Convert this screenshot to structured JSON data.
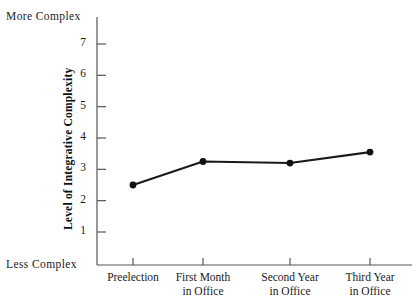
{
  "chart_data": {
    "type": "line",
    "title": "",
    "subtitle": "",
    "xlabel": "",
    "ylabel": "Level of Integrative Complexity",
    "categories": [
      "Preelection",
      "First Month\nin Office",
      "Second Year\nin Office",
      "Third Year\nin Office"
    ],
    "series": [
      {
        "name": "Integrative Complexity",
        "values": [
          2.5,
          3.25,
          3.2,
          3.55
        ]
      }
    ],
    "yticks": [
      1,
      2,
      3,
      4,
      5,
      6,
      7
    ],
    "ytick_labels": [
      "1",
      "2",
      "3",
      "4",
      "5",
      "6",
      "7"
    ],
    "ylim": [
      0,
      7.55
    ],
    "grid": false,
    "legend": false,
    "legend_position": "none",
    "annotations": [
      {
        "name": "axis-top-anchor",
        "text": "More Complex"
      },
      {
        "name": "axis-bottom-anchor",
        "text": "Less Complex"
      }
    ],
    "marker": "circle",
    "line_color": "#1a1a1a",
    "marker_color": "#111111"
  },
  "axis": {
    "top_anchor": "More Complex",
    "bottom_anchor": "Less Complex",
    "y_title": "Level of Integrative Complexity"
  },
  "yticks": [
    {
      "value": 7,
      "label": "7"
    },
    {
      "value": 6,
      "label": "6"
    },
    {
      "value": 5,
      "label": "5"
    },
    {
      "value": 4,
      "label": "4"
    },
    {
      "value": 3,
      "label": "3"
    },
    {
      "value": 2,
      "label": "2"
    },
    {
      "value": 1,
      "label": "1"
    }
  ],
  "xticks": [
    {
      "label": "Preelection",
      "line1": "Preelection",
      "line2": ""
    },
    {
      "label": "First Month in Office",
      "line1": "First Month",
      "line2": "in Office"
    },
    {
      "label": "Second Year in Office",
      "line1": "Second Year",
      "line2": "in Office"
    },
    {
      "label": "Third Year in Office",
      "line1": "Third Year",
      "line2": "in Office"
    }
  ],
  "colors": {
    "line": "#1a1a1a",
    "axis": "#555555",
    "background": "#ffffff",
    "text": "#1a1a1a"
  }
}
